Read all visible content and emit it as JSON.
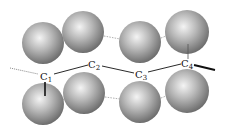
{
  "diagram": {
    "type": "molecular-chain-between-sphere-rows",
    "colors": {
      "sphere_light": "#f4f4f4",
      "sphere_mid": "#b4b4b4",
      "sphere_dark": "#6a6a6a",
      "chain": "#111111",
      "dotted": "#888888"
    },
    "spheres": {
      "top": [
        {
          "cx": 43,
          "cy": 43,
          "r": 21
        },
        {
          "cx": 83,
          "cy": 32,
          "r": 21
        },
        {
          "cx": 140,
          "cy": 42,
          "r": 21
        },
        {
          "cx": 187,
          "cy": 32,
          "r": 22
        }
      ],
      "bottom": [
        {
          "cx": 43,
          "cy": 104,
          "r": 21
        },
        {
          "cx": 84,
          "cy": 93,
          "r": 21
        },
        {
          "cx": 140,
          "cy": 102,
          "r": 21
        },
        {
          "cx": 187,
          "cy": 91,
          "r": 22
        }
      ]
    },
    "atoms": [
      {
        "id": "c1",
        "letter": "C",
        "sub": "1"
      },
      {
        "id": "c2",
        "letter": "C",
        "sub": "2"
      },
      {
        "id": "c3",
        "letter": "C",
        "sub": "3"
      },
      {
        "id": "c4",
        "letter": "C",
        "sub": "4"
      }
    ]
  }
}
